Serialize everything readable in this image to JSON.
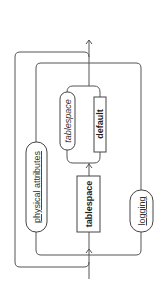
{
  "diagram": {
    "type": "railroad-syntax-diagram",
    "orientation": "rotated-90-ccw",
    "nodes": {
      "physical_attributes": "physical attributes",
      "tablespace_keyword": "tablespace",
      "tablespace_name": "tablespace",
      "default_keyword": "default",
      "logging": "logging"
    },
    "colors": {
      "line": "#555555",
      "border": "#444444",
      "text": "#222222",
      "background": "#ffffff"
    }
  }
}
